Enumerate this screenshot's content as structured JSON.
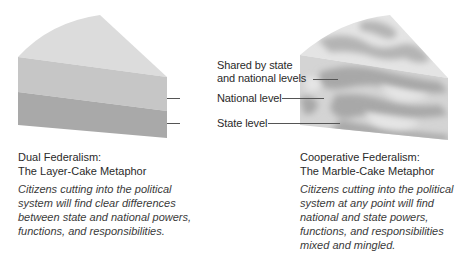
{
  "layer_cake": {
    "title_line1": "Dual Federalism:",
    "title_line2": "The Layer-Cake Metaphor",
    "description_lines": [
      "Citizens cutting into the political",
      "system will find clear differences",
      "between state and national powers,",
      "functions, and responsibilities."
    ],
    "colors": {
      "top": "#dcdcdc",
      "national_layer": "#c4c4c4",
      "state_layer": "#a8a8a8"
    }
  },
  "marble_cake": {
    "title_line1": "Cooperative Federalism:",
    "title_line2": "The Marble-Cake Metaphor",
    "description_lines": [
      "Citizens cutting into the political",
      "system at any point will find",
      "national and state powers,",
      "functions, and responsibilities",
      "mixed and mingled."
    ],
    "colors": {
      "light": "#e2e2e2",
      "dark": "#a9a9a9"
    }
  },
  "legend": {
    "shared_line1": "Shared by state",
    "shared_line2": "and national levels",
    "national": "National level",
    "state": "State level"
  }
}
